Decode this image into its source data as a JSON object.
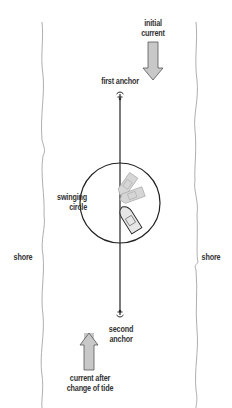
{
  "diagram": {
    "type": "anchoring-diagram",
    "labels": {
      "initial_current_line1": "initial",
      "initial_current_line2": "current",
      "first_anchor": "first anchor",
      "swinging_circle_line1": "swinging",
      "swinging_circle_line2": "circle",
      "shore_left": "shore",
      "shore_right": "shore",
      "second_anchor_line1": "second",
      "second_anchor_line2": "anchor",
      "current_after_line1": "current after",
      "current_after_line2": "change of tide"
    },
    "colors": {
      "line": "#222222",
      "shore": "#999999",
      "arrow_fill": "#c8c8c8",
      "arrow_stroke": "#555555",
      "boat_fill": "#e6e6e6",
      "boat_ghost_fill": "#d6d6d6",
      "text": "#333333"
    },
    "elements": {
      "anchor_line": {
        "x": 120,
        "y1": 92,
        "y2": 316
      },
      "swinging_circle": {
        "cx": 120,
        "cy": 203,
        "r": 40
      },
      "boat_positions": 3
    }
  }
}
